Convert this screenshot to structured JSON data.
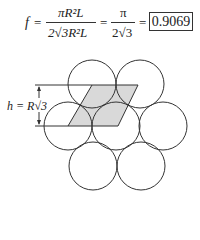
{
  "formula": {
    "lhs": "f",
    "equals": "=",
    "frac1": {
      "numerator": "πR²L",
      "denominator": "2√3R²L"
    },
    "frac2": {
      "numerator": "π",
      "denominator": "2√3"
    },
    "result": "0.9069"
  },
  "diagram": {
    "height_label": "h = R√3",
    "circle_radius": 24,
    "circles": [
      {
        "cx": 92,
        "cy": 84
      },
      {
        "cx": 140,
        "cy": 84
      },
      {
        "cx": 68,
        "cy": 126
      },
      {
        "cx": 116,
        "cy": 126
      },
      {
        "cx": 163,
        "cy": 126
      },
      {
        "cx": 93,
        "cy": 166
      },
      {
        "cx": 141,
        "cy": 166
      }
    ],
    "parallelogram": [
      [
        92,
        85
      ],
      [
        138,
        85
      ],
      [
        118,
        126
      ],
      [
        68,
        126
      ]
    ],
    "fill_color": "#d9d9d9",
    "stroke_color": "#333333"
  }
}
